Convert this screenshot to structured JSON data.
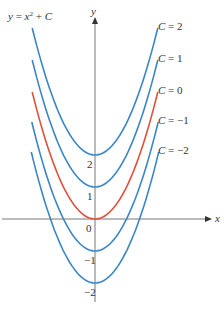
{
  "chart_data": {
    "type": "line",
    "xlabel": "x",
    "ylabel": "y",
    "origin_label": "0",
    "y_tick_labels": [
      "2",
      "1",
      "−1",
      "−2"
    ],
    "y_ticks": [
      2,
      1,
      -1,
      -2
    ],
    "xlim": [
      -2.0,
      2.0
    ],
    "series": [
      {
        "name": "C = 2",
        "C": 2,
        "color": "#3a86c8",
        "x": [
          -2,
          -1,
          0,
          1,
          2
        ],
        "values": [
          6,
          3,
          2,
          3,
          6
        ]
      },
      {
        "name": "C = 1",
        "C": 1,
        "color": "#3a86c8",
        "x": [
          -2,
          -1,
          0,
          1,
          2
        ],
        "values": [
          5,
          2,
          1,
          2,
          5
        ]
      },
      {
        "name": "C = 0",
        "C": 0,
        "color": "#e0503a",
        "x": [
          -2,
          -1,
          0,
          1,
          2
        ],
        "values": [
          4,
          1,
          0,
          1,
          4
        ]
      },
      {
        "name": "C = −1",
        "C": -1,
        "color": "#3a86c8",
        "x": [
          -2,
          -1,
          0,
          1,
          2
        ],
        "values": [
          3,
          0,
          -1,
          0,
          3
        ]
      },
      {
        "name": "C = −2",
        "C": -2,
        "color": "#3a86c8",
        "x": [
          -2,
          -1,
          0,
          1,
          2
        ],
        "values": [
          2,
          -1,
          -2,
          -1,
          2
        ]
      }
    ],
    "grid": false,
    "legend_position": "right, inline labels at curve ends"
  }
}
